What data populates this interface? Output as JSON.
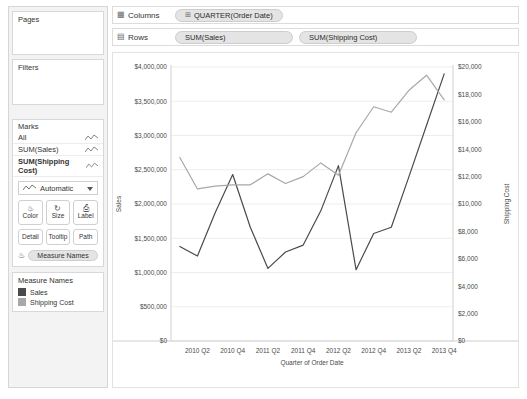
{
  "sidebar": {
    "pages": {
      "title": "Pages"
    },
    "filters": {
      "title": "Filters"
    },
    "marks": {
      "title": "Marks",
      "rows": [
        {
          "label": "All",
          "selected": false
        },
        {
          "label": "SUM(Sales)",
          "selected": false
        },
        {
          "label": "SUM(Shipping Cost)",
          "selected": true
        }
      ],
      "mark_type": "Automatic",
      "buttons": [
        {
          "label": "Color",
          "icon": "color-icon"
        },
        {
          "label": "Size",
          "icon": "size-icon"
        },
        {
          "label": "Label",
          "icon": "label-icon"
        },
        {
          "label": "Detail",
          "icon": "detail-icon"
        },
        {
          "label": "Tooltip",
          "icon": "tooltip-icon"
        },
        {
          "label": "Path",
          "icon": "path-icon"
        }
      ],
      "measure_names_pill": "Measure Names"
    },
    "legend": {
      "title": "Measure Names",
      "items": [
        {
          "label": "Sales",
          "color": "#4a4a4a"
        },
        {
          "label": "Shipping Cost",
          "color": "#a8a8a8"
        }
      ]
    }
  },
  "shelves": {
    "columns": {
      "label": "Columns",
      "pills": [
        {
          "text": "QUARTER(Order Date)",
          "has_plus": true
        }
      ]
    },
    "rows": {
      "label": "Rows",
      "pills": [
        {
          "text": "SUM(Sales)",
          "has_plus": false
        },
        {
          "text": "SUM(Shipping Cost)",
          "has_plus": false
        }
      ]
    }
  },
  "chart_data": {
    "type": "line",
    "title": "",
    "xlabel": "Quarter of Order Date",
    "grid": true,
    "legend_position": "sidebar",
    "x": [
      "2010 Q1",
      "2010 Q2",
      "2010 Q3",
      "2010 Q4",
      "2011 Q1",
      "2011 Q2",
      "2011 Q3",
      "2011 Q4",
      "2012 Q1",
      "2012 Q2",
      "2012 Q3",
      "2012 Q4",
      "2013 Q1",
      "2013 Q2",
      "2013 Q3",
      "2013 Q4"
    ],
    "xtick_labels": [
      "2010 Q2",
      "2010 Q4",
      "2011 Q2",
      "2011 Q4",
      "2012 Q2",
      "2012 Q4",
      "2013 Q2",
      "2013 Q4"
    ],
    "xtick_indices": [
      1,
      3,
      5,
      7,
      9,
      11,
      13,
      15
    ],
    "axes": [
      {
        "id": "left",
        "ylabel": "Sales",
        "ylim": [
          0,
          4000000
        ],
        "ticks": [
          0,
          500000,
          1000000,
          1500000,
          2000000,
          2500000,
          3000000,
          3500000,
          4000000
        ],
        "tick_labels": [
          "$0",
          "$500,000",
          "$1,000,000",
          "$1,500,000",
          "$2,000,000",
          "$2,500,000",
          "$3,000,000",
          "$3,500,000",
          "$4,000,000"
        ]
      },
      {
        "id": "right",
        "ylabel": "Shipping Cost",
        "ylim": [
          0,
          20000
        ],
        "ticks": [
          0,
          2000,
          4000,
          6000,
          8000,
          10000,
          12000,
          14000,
          16000,
          18000,
          20000
        ],
        "tick_labels": [
          "$0",
          "$2,000",
          "$4,000",
          "$6,000",
          "$8,000",
          "$10,000",
          "$12,000",
          "$14,000",
          "$16,000",
          "$18,000",
          "$20,000"
        ]
      }
    ],
    "series": [
      {
        "name": "Sales",
        "axis": "left",
        "color": "#4a4a4a",
        "values": [
          1380000,
          1240000,
          1870000,
          2430000,
          1660000,
          1060000,
          1300000,
          1400000,
          1900000,
          2560000,
          1040000,
          1570000,
          1660000,
          2400000,
          3150000,
          3900000
        ]
      },
      {
        "name": "Shipping Cost",
        "axis": "right",
        "color": "#a8a8a8",
        "values": [
          13400,
          11100,
          11300,
          11400,
          11400,
          12200,
          11500,
          12000,
          13000,
          12100,
          15200,
          17100,
          16700,
          18300,
          19400,
          17600
        ]
      }
    ]
  }
}
